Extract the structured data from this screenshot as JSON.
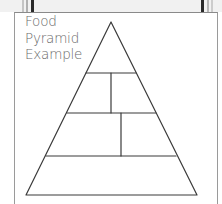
{
  "title": {
    "lines": [
      "Food",
      "Pyramid",
      "Example"
    ]
  },
  "colors": {
    "line": "#3a3a3a",
    "title_text": "#6a6a6a",
    "card_border": "#9a9a9a",
    "top_strip": "#f1f1f1",
    "dark_bar": "#2a2a2a",
    "light_bar": "#b8b8b8"
  },
  "pyramid": {
    "apex": [
      111,
      22
    ],
    "base_left": [
      26,
      195
    ],
    "base_right": [
      197,
      195
    ],
    "tiers": [
      {
        "y": 73,
        "x1": 87,
        "x2": 137,
        "divider_x": 111,
        "divider_to": 113
      },
      {
        "y": 113,
        "x1": 67,
        "x2": 156,
        "divider_x": 121,
        "divider_to": 156
      },
      {
        "y": 156,
        "x1": 47,
        "x2": 177
      }
    ]
  }
}
